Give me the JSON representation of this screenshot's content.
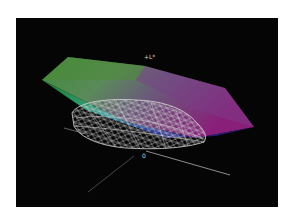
{
  "figure": {
    "background": "#ffffff",
    "panel_background": "#050505",
    "axis_labels": {
      "l_axis": "+L*",
      "origin": "0"
    },
    "solids": [
      {
        "name": "reference-gamut",
        "style": "shaded",
        "colors": [
          "#2e8a3a",
          "#33a06a",
          "#3aa0a0",
          "#6a4a8a",
          "#8a2080",
          "#2a2a90",
          "#a8a060"
        ]
      },
      {
        "name": "device-gamut",
        "style": "wireframe",
        "stroke": "#d8d8d8"
      }
    ]
  }
}
